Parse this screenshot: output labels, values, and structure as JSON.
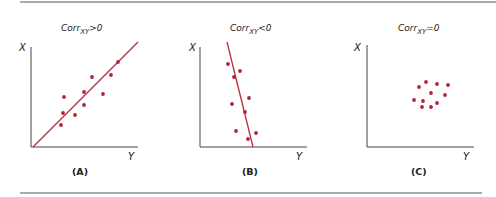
{
  "chart_data": [
    {
      "type": "scatter",
      "panel_label": "(A)",
      "title": "Corr_XY > 0",
      "title_main": "Corr",
      "title_sub": "XY",
      "title_rel": ">0",
      "xlabel": "Y",
      "ylabel": "X",
      "trend_line": "positive slope",
      "points_px": [
        [
          118,
          62
        ],
        [
          111,
          75
        ],
        [
          92,
          77
        ],
        [
          84,
          92
        ],
        [
          103,
          94
        ],
        [
          64,
          97
        ],
        [
          84,
          105
        ],
        [
          63,
          113
        ],
        [
          75,
          115
        ],
        [
          61,
          125
        ]
      ]
    },
    {
      "type": "scatter",
      "panel_label": "(B)",
      "title": "Corr_XY < 0",
      "title_main": "Corr",
      "title_sub": "XY",
      "title_rel": "<0",
      "xlabel": "Y",
      "ylabel": "X",
      "trend_line": "negative slope (steep)",
      "points_px": [
        [
          228,
          64
        ],
        [
          240,
          71
        ],
        [
          234,
          77
        ],
        [
          249,
          98
        ],
        [
          232,
          104
        ],
        [
          245,
          112
        ],
        [
          236,
          131
        ],
        [
          256,
          133
        ],
        [
          248,
          139
        ]
      ]
    },
    {
      "type": "scatter",
      "panel_label": "(C)",
      "title": "Corr_XY = 0",
      "title_main": "Corr",
      "title_sub": "XY",
      "title_rel": "=0",
      "xlabel": "Y",
      "ylabel": "X",
      "trend_line": "none",
      "points_px": [
        [
          426,
          82
        ],
        [
          419,
          87
        ],
        [
          437,
          84
        ],
        [
          448,
          85
        ],
        [
          431,
          93
        ],
        [
          445,
          95
        ],
        [
          414,
          100
        ],
        [
          423,
          101
        ],
        [
          437,
          103
        ],
        [
          422,
          107
        ],
        [
          431,
          107
        ]
      ]
    }
  ],
  "colors": {
    "point": "#b5213a",
    "line": "#c0283a",
    "axis": "#444444",
    "rule": "#555555"
  }
}
